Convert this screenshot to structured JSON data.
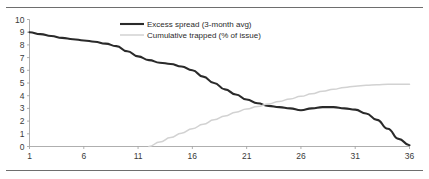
{
  "chart_data": {
    "type": "line",
    "title": "",
    "xlabel": "",
    "ylabel": "",
    "xlim": [
      1,
      36
    ],
    "ylim": [
      0,
      10
    ],
    "grid": false,
    "legend_position": "top-center",
    "x_ticks": [
      "1",
      "6",
      "11",
      "16",
      "21",
      "26",
      "31",
      "36"
    ],
    "x_tick_values": [
      1,
      6,
      11,
      16,
      21,
      26,
      31,
      36
    ],
    "y_ticks": [
      "0",
      "1",
      "2",
      "3",
      "4",
      "5",
      "6",
      "7",
      "8",
      "9",
      "10"
    ],
    "y_tick_values": [
      0,
      1,
      2,
      3,
      4,
      5,
      6,
      7,
      8,
      9,
      10
    ],
    "x": [
      1,
      2,
      3,
      4,
      5,
      6,
      7,
      8,
      9,
      10,
      11,
      12,
      13,
      14,
      15,
      16,
      17,
      18,
      19,
      20,
      21,
      22,
      23,
      24,
      25,
      26,
      27,
      28,
      29,
      30,
      31,
      32,
      33,
      34,
      35,
      36
    ],
    "series": [
      {
        "name": "Excess spread (3-month avg)",
        "color": "#2a2a2a",
        "values": [
          9.0,
          8.85,
          8.7,
          8.55,
          8.45,
          8.35,
          8.25,
          8.1,
          7.9,
          7.5,
          7.1,
          6.8,
          6.6,
          6.5,
          6.3,
          6.0,
          5.5,
          5.0,
          4.5,
          4.1,
          3.7,
          3.4,
          3.2,
          3.1,
          3.0,
          2.85,
          3.0,
          3.1,
          3.1,
          3.0,
          2.9,
          2.6,
          2.1,
          1.4,
          0.6,
          0.1
        ]
      },
      {
        "name": "Cumulative trapped (% of issue)",
        "color": "#d2d2d2",
        "values": [
          null,
          null,
          null,
          null,
          null,
          null,
          null,
          null,
          null,
          null,
          null,
          0.0,
          0.35,
          0.7,
          1.05,
          1.4,
          1.75,
          2.1,
          2.4,
          2.7,
          2.95,
          3.15,
          3.35,
          3.55,
          3.75,
          3.95,
          4.15,
          4.35,
          4.5,
          4.65,
          4.75,
          4.82,
          4.87,
          4.9,
          4.9,
          4.9
        ]
      }
    ]
  },
  "legend": {
    "items": [
      {
        "label": "Excess spread (3-month avg)",
        "swatch": "solid-thick-dark"
      },
      {
        "label": "Cumulative trapped (% of issue)",
        "swatch": "solid-thin-light"
      }
    ]
  }
}
